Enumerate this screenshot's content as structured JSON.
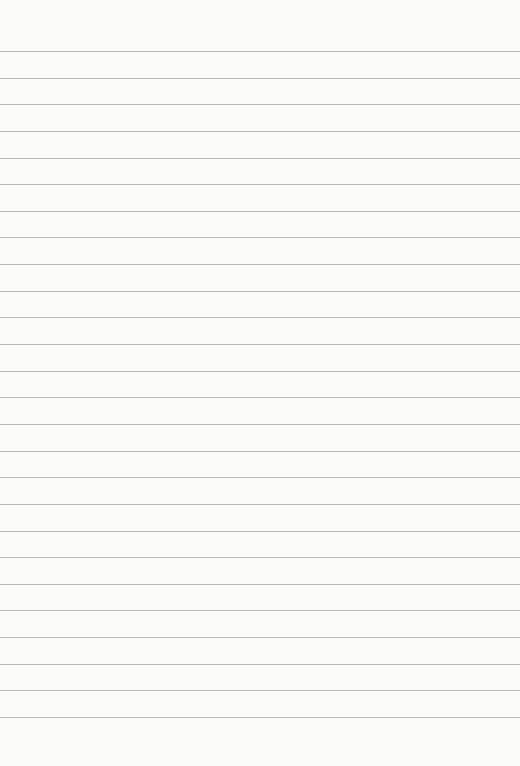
{
  "sheet": {
    "type": "lined-paper",
    "background_color": "#fbfbfa",
    "rule_color": "#b9b9b9",
    "first_rule_y": 51,
    "rule_spacing": 26.64,
    "rule_count": 26
  }
}
